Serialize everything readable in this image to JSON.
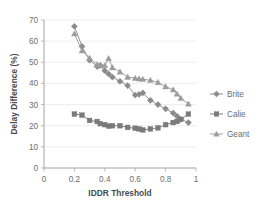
{
  "chart_data": {
    "type": "line",
    "title": "",
    "xlabel": "IDDR Threshold",
    "ylabel": "Delay Difference (%)",
    "xlim": [
      0,
      1
    ],
    "ylim": [
      0,
      70
    ],
    "xticks": [
      "0",
      "0.2",
      "0.4",
      "0.6",
      "0.8",
      "1"
    ],
    "xtick_values": [
      0,
      0.2,
      0.4,
      0.6,
      0.8,
      1
    ],
    "yticks": [
      "0",
      "10",
      "20",
      "30",
      "40",
      "50",
      "60",
      "70"
    ],
    "ytick_values": [
      0,
      10,
      20,
      30,
      40,
      50,
      60,
      70
    ],
    "grid": false,
    "legend_position": "right",
    "x": [
      0.2,
      0.25,
      0.3,
      0.35,
      0.37,
      0.4,
      0.425,
      0.45,
      0.5,
      0.55,
      0.6,
      0.625,
      0.65,
      0.7,
      0.75,
      0.8,
      0.85,
      0.875,
      0.9,
      0.95
    ],
    "series": [
      {
        "name": "Brite",
        "marker": "diamond",
        "color": "#8a8a8a",
        "values": [
          67.0,
          57.5,
          51.0,
          48.0,
          48.5,
          46.0,
          44.5,
          43.0,
          41.0,
          39.0,
          34.5,
          34.8,
          35.5,
          32.0,
          30.0,
          28.0,
          26.0,
          24.5,
          23.0,
          21.5
        ]
      },
      {
        "name": "Calie",
        "marker": "square",
        "color": "#7a7a7a",
        "values": [
          25.5,
          25.0,
          22.5,
          22.0,
          21.0,
          20.5,
          19.8,
          20.0,
          20.0,
          19.2,
          18.8,
          18.5,
          18.0,
          18.5,
          19.0,
          20.5,
          21.5,
          22.0,
          23.0,
          25.5
        ]
      },
      {
        "name": "Geant",
        "marker": "triangle",
        "color": "#9c9c9c",
        "values": [
          63.5,
          55.5,
          52.0,
          49.0,
          48.5,
          48.5,
          51.8,
          47.5,
          45.5,
          43.0,
          42.5,
          42.2,
          42.0,
          41.5,
          40.5,
          38.5,
          37.0,
          35.0,
          33.0,
          30.3
        ]
      }
    ]
  },
  "legend": {
    "items": [
      {
        "label": "Brite"
      },
      {
        "label": "Calie"
      },
      {
        "label": "Geant"
      }
    ]
  }
}
